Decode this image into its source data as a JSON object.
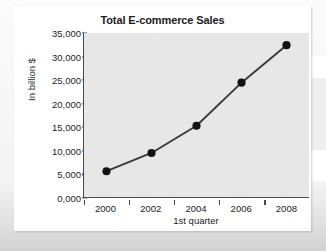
{
  "chart_data": {
    "type": "line",
    "title": "Total E-commerce Sales",
    "xlabel": "1st quarter",
    "ylabel": "In billion $",
    "categories": [
      "2000",
      "2002",
      "2004",
      "2006",
      "2008"
    ],
    "x": [
      2000,
      2002,
      2004,
      2006,
      2008
    ],
    "values": [
      5500,
      9400,
      15200,
      24400,
      32400
    ],
    "series": [
      {
        "name": "Total E-commerce Sales",
        "values": [
          5500,
          9400,
          15200,
          24400,
          32400
        ]
      }
    ],
    "ylim": [
      0,
      35000
    ],
    "xlim": [
      1999,
      2009
    ],
    "ytick_labels": [
      "35,000",
      "30,000",
      "25,000",
      "20,000",
      "15,000",
      "10,000",
      "5,000",
      "0,000"
    ],
    "ytick_values": [
      35000,
      30000,
      25000,
      20000,
      15000,
      10000,
      5000,
      0
    ],
    "xtick_labels": [
      "2000",
      "2002",
      "2004",
      "2006",
      "2008"
    ],
    "grid": false,
    "legend": "none",
    "marker": "circle",
    "plot_background": "#e7e7e7",
    "line_color": "#3a3a3a",
    "marker_color": "#121212",
    "text_color": "#1d1d1d",
    "card_background": "#ffffff"
  }
}
